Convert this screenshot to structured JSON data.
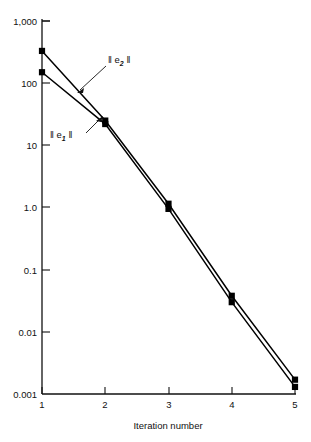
{
  "chart_data": {
    "type": "line",
    "title": "",
    "subtitle": "",
    "xlabel": "Iteration number",
    "ylabel": "",
    "xscale": "linear",
    "yscale": "log",
    "x": [
      1,
      2,
      3,
      4,
      5
    ],
    "xlim": [
      1,
      5
    ],
    "ylim": [
      0.001,
      1000
    ],
    "xticks": [
      "1",
      "2",
      "3",
      "4",
      "5"
    ],
    "yticks": [
      "1,000",
      "100",
      "10",
      "1.0",
      "0.1",
      "0.01",
      "0.001"
    ],
    "ytick_values": [
      1000,
      100,
      10,
      1.0,
      0.1,
      0.01,
      0.001
    ],
    "grid": false,
    "legend": "inline-annotations",
    "marker": "square",
    "series": [
      {
        "name": "|| e2 ||",
        "label_main": "‖ e",
        "label_sub": "2",
        "label_tail": " ‖",
        "values": [
          330,
          25,
          1.15,
          0.038,
          0.0017
        ],
        "color": "#000000"
      },
      {
        "name": "|| e1 ||",
        "label_main": "‖ e",
        "label_sub": "1",
        "label_tail": " ‖",
        "values": [
          150,
          22,
          0.95,
          0.03,
          0.0013
        ],
        "color": "#000000"
      }
    ],
    "annotations": [
      {
        "id": "label-e2",
        "text": "‖ e2 ‖",
        "text_main": "‖ e",
        "text_sub": "2",
        "text_tail": " ‖",
        "x_px": 108,
        "y_px": 62,
        "arrow_from_px": [
          106,
          66
        ],
        "arrow_to_px": [
          78,
          92
        ]
      },
      {
        "id": "label-e1",
        "text": "‖ e1 ‖",
        "text_main": "‖ e",
        "text_sub": "1",
        "text_tail": " ‖",
        "x_px": 52,
        "y_px": 136,
        "arrow_from_px": [
          84,
          133
        ],
        "arrow_to_px": [
          101,
          118
        ]
      }
    ]
  }
}
